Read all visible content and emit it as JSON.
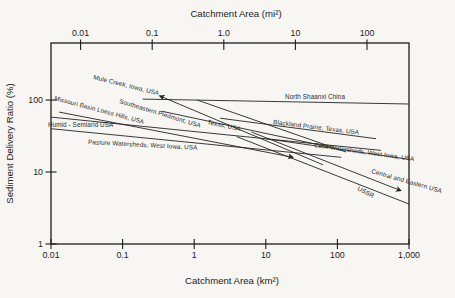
{
  "figure": {
    "title_top": "Catchment Area (mi²)",
    "title_bottom": "Catchment Area (km²)",
    "title_left": "Sediment Delivery Ratio (%)"
  },
  "chart_data": {
    "type": "line",
    "x_scale": "log",
    "y_scale": "log",
    "xlabel": "Catchment Area (km²)",
    "xlabel_top": "Catchment Area (mi²)",
    "ylabel": "Sediment Delivery Ratio (%)",
    "xlim": [
      0.01,
      1000
    ],
    "ylim": [
      1,
      620
    ],
    "grid": false,
    "legend": "labels drawn along each line",
    "mi2_to_km2": 2.59,
    "x_ticks_bottom": {
      "labels": [
        "0.01",
        "0.1",
        "1",
        "10",
        "100",
        "1,000"
      ],
      "values": [
        0.01,
        0.1,
        1,
        10,
        100,
        1000
      ]
    },
    "x_ticks_top": {
      "labels": [
        "0.01",
        "0.1",
        "1.0",
        "10",
        "100"
      ],
      "values_mi2": [
        0.01,
        0.1,
        1,
        10,
        100
      ]
    },
    "y_ticks": {
      "labels": [
        "1",
        "10",
        "100"
      ],
      "values": [
        1,
        10,
        100
      ]
    },
    "series": [
      {
        "id": "mule-creek",
        "label": "Mule Creek, Iowa, USA",
        "points": [
          [
            0.33,
            114
          ],
          [
            63,
            12.6
          ]
        ],
        "arrow": "start",
        "label_px": [
          93,
          79
        ],
        "label_rotation": 14
      },
      {
        "id": "missouri-basin",
        "label": "Missouri Basin Loess Hills, USA",
        "points": [
          [
            0.013,
            68
          ],
          [
            24,
            16
          ]
        ],
        "arrow": "end",
        "label_px": [
          54,
          100
        ],
        "label_rotation": 15
      },
      {
        "id": "southeastern-piedmont",
        "label": "Southeastern Piedmont, USA",
        "points": [
          [
            1.1,
            100
          ],
          [
            132,
            19
          ]
        ],
        "arrow": null,
        "label_px": [
          119,
          103
        ],
        "label_rotation": 17
      },
      {
        "id": "humid-semiarid",
        "label": "Humid - Semiarid USA",
        "points": [
          [
            0.01,
            58
          ],
          [
            406,
            20
          ]
        ],
        "arrow": null,
        "label_px": [
          48,
          127
        ],
        "label_rotation": 0
      },
      {
        "id": "pasture-watersheds",
        "label": "Pasture Watersheds, West Iowa, USA",
        "points": [
          [
            0.01,
            40
          ],
          [
            113,
            16
          ]
        ],
        "arrow": null,
        "label_px": [
          88,
          144
        ],
        "label_rotation": 3
      },
      {
        "id": "texas",
        "label": "Texas, USA",
        "points": [
          [
            0.35,
            70
          ],
          [
            82,
            22
          ]
        ],
        "arrow": null,
        "label_px": [
          207,
          124
        ],
        "label_rotation": 12
      },
      {
        "id": "north-shaanxi",
        "label": "North Shaanxi China",
        "points": [
          [
            0.19,
            103
          ],
          [
            1000,
            88
          ]
        ],
        "arrow": null,
        "label_px": [
          285,
          99
        ],
        "label_rotation": 0
      },
      {
        "id": "blackland-prairie",
        "label": "Blackland Prairie, Texas, USA",
        "points": [
          [
            2.3,
            56
          ],
          [
            346,
            29
          ]
        ],
        "arrow": null,
        "label_px": [
          273,
          124
        ],
        "label_rotation": 7
      },
      {
        "id": "corn-watersheds",
        "label": "Corn Watersheds, West Iowa, USA",
        "points": [
          [
            10,
            29
          ],
          [
            1000,
            15
          ]
        ],
        "arrow": null,
        "label_px": [
          314,
          147
        ],
        "label_rotation": 8
      },
      {
        "id": "central-eastern-usa",
        "label": "Central and Eastern USA",
        "points": [
          [
            6.3,
            36
          ],
          [
            770,
            5.5
          ]
        ],
        "arrow": "end",
        "label_px": [
          371,
          173
        ],
        "label_rotation": 16
      },
      {
        "id": "ussr",
        "label": "USSR",
        "points": [
          [
            3.9,
            31
          ],
          [
            1000,
            3.6
          ]
        ],
        "arrow": null,
        "label_px": [
          357,
          190
        ],
        "label_rotation": 27
      }
    ]
  },
  "colors": {
    "ink": "#1c1c1c",
    "line": "#242424",
    "background": "#f7f6f2"
  }
}
